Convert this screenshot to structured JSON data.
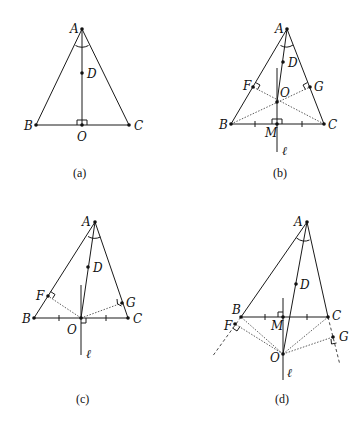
{
  "figure": {
    "panels": [
      {
        "id": "a",
        "caption": "(a)",
        "points": {
          "A": "A",
          "B": "B",
          "C": "C",
          "D": "D",
          "O": "O"
        }
      },
      {
        "id": "b",
        "caption": "(b)",
        "points": {
          "A": "A",
          "B": "B",
          "C": "C",
          "D": "D",
          "O": "O",
          "M": "M",
          "F": "F",
          "G": "G",
          "l": "ℓ"
        }
      },
      {
        "id": "c",
        "caption": "(c)",
        "points": {
          "A": "A",
          "B": "B",
          "C": "C",
          "D": "D",
          "O": "O",
          "F": "F",
          "G": "G",
          "l": "ℓ"
        }
      },
      {
        "id": "d",
        "caption": "(d)",
        "points": {
          "A": "A",
          "B": "B",
          "C": "C",
          "D": "D",
          "O": "O",
          "M": "M",
          "F": "F",
          "G": "G",
          "l": "ℓ"
        }
      }
    ]
  }
}
